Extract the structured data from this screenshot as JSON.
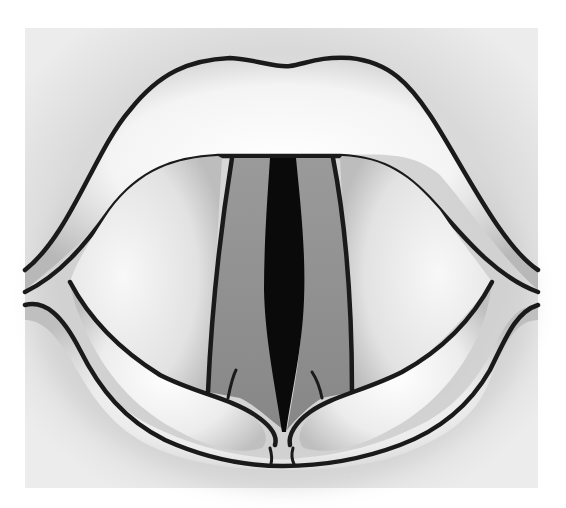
{
  "figure": {
    "style": "grayscale medical illustration",
    "colors": {
      "background": "#ffffff",
      "panel": "#e6e6e6",
      "tissue_light": "#f7f7f7",
      "vocal_fold": "#8f8f8f",
      "glottis": "#0a0a0a",
      "outline": "#1a1a1a"
    }
  }
}
